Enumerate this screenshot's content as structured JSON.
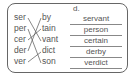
{
  "exercise": {
    "letter": "d.",
    "left_syllables": [
      "ser",
      "per",
      "cer",
      "der",
      "ver"
    ],
    "right_syllables": [
      "by",
      "tain",
      "vant",
      "dict",
      "son"
    ],
    "answers": [
      "servant",
      "person",
      "certain",
      "derby",
      "verdict"
    ],
    "matches": [
      [
        0,
        2
      ],
      [
        1,
        4
      ],
      [
        2,
        1
      ],
      [
        3,
        0
      ],
      [
        4,
        3
      ]
    ]
  }
}
